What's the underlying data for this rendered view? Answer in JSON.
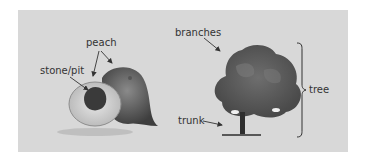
{
  "diagram": {
    "left": {
      "subject": "peach",
      "labels": {
        "peach": "peach",
        "stone": "stone/pit"
      }
    },
    "right": {
      "subject": "tree",
      "labels": {
        "branches": "branches",
        "trunk": "trunk",
        "tree": "tree"
      }
    },
    "colors": {
      "panel": "#d8d8d8",
      "text": "#333333",
      "arrow": "#333333"
    }
  }
}
